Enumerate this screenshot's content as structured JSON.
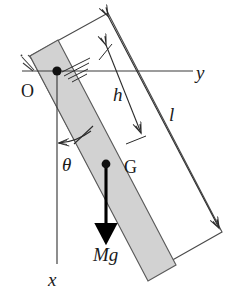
{
  "figure": {
    "background_color": "#ffffff",
    "line_color": "#2b2b2b",
    "bar_fill_color": "#d2d2d2",
    "bar_stroke_color": "#555555",
    "force_color": "#000000"
  },
  "labels": {
    "axis_y": "y",
    "axis_x": "x",
    "distance_h": "h",
    "length_l": "l",
    "angle_theta": "θ",
    "pivot_O": "O",
    "centroid_G": "G",
    "force_Mg": "Mg"
  },
  "geometry": {
    "pivot_point": {
      "x": 57,
      "y": 71
    },
    "centroid_point": {
      "x": 106,
      "y": 164
    },
    "y_axis": {
      "x1": 22,
      "y1": 71,
      "x2": 193,
      "y2": 71
    },
    "x_axis": {
      "x1": 57,
      "y1": 71,
      "x2": 57,
      "y2": 268
    },
    "bar_angle_degrees": 28,
    "weight_arrow": {
      "x1": 106,
      "y1": 164,
      "x2": 106,
      "y2": 237
    },
    "dimension_h": {
      "x1": 106,
      "y1": 45,
      "x2": 142,
      "y2": 134
    },
    "dimension_l": {
      "x1": 108,
      "y1": 13,
      "x2": 222,
      "y2": 232
    }
  },
  "icon_names": {
    "pivot_marker": "pivot-dot-icon",
    "centroid_marker": "centroid-dot-icon",
    "ground_hatch": "fixed-support-hatch-icon",
    "weight_vector": "downward-force-arrow-icon",
    "angle_indicator": "angle-arc-arrow-icon"
  }
}
